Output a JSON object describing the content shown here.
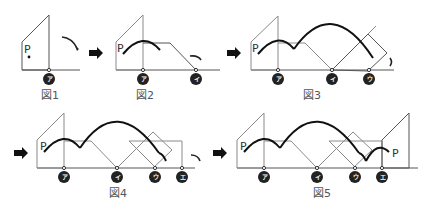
{
  "figures": [
    {
      "id": "fig1",
      "caption": "図1",
      "point_label": "P",
      "markers": [
        "ア"
      ]
    },
    {
      "id": "fig2",
      "caption": "図2",
      "point_label": "P",
      "markers": [
        "ア",
        "イ"
      ]
    },
    {
      "id": "fig3",
      "caption": "図3",
      "point_label": "P",
      "markers": [
        "ア",
        "イ",
        "ウ"
      ]
    },
    {
      "id": "fig4",
      "caption": "図4",
      "point_label": "P",
      "markers": [
        "ア",
        "イ",
        "ウ",
        "エ"
      ]
    },
    {
      "id": "fig5",
      "caption": "図5",
      "point_label": "P",
      "point_label_end": "P",
      "markers": [
        "ア",
        "イ",
        "ウ",
        "エ"
      ]
    }
  ],
  "arrows": [
    "next-step",
    "next-step",
    "next-step",
    "next-step"
  ],
  "colors": {
    "outline": "#8a8a8a",
    "path": "#111111",
    "marker": "#222222"
  }
}
